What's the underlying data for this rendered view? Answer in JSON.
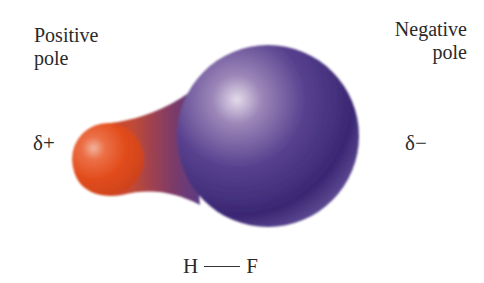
{
  "labels": {
    "positive_pole": [
      "Positive",
      "pole"
    ],
    "negative_pole": [
      "Negative",
      "pole"
    ],
    "delta_plus": "δ+",
    "delta_minus": "δ−"
  },
  "bond": {
    "atom_left": "H",
    "atom_right": "F"
  },
  "colors": {
    "positive_region": "#e8501e",
    "negative_region": "#3f2a7a",
    "highlight": "#e6dcec"
  }
}
